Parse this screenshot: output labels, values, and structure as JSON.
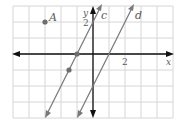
{
  "graph": {
    "origin_px": [
      93,
      54
    ],
    "unit_px": 16,
    "x_range": [
      -5,
      5
    ],
    "y_range": [
      -4,
      3
    ],
    "grid_color": "#d6d6d6",
    "axis_color": "#111111",
    "line_color": "#7a7a7a",
    "point_color": "#6e6e6e",
    "axes": {
      "x_label": "x",
      "y_label": "y",
      "x_tick_label": "2",
      "y_tick_label": "2"
    },
    "point_A": {
      "label": "A",
      "x": -3,
      "y": 2
    },
    "line_c": {
      "label": "c",
      "slope": 2,
      "points": [
        {
          "x": -1,
          "y": 0
        },
        {
          "x": -1.5,
          "y": -1
        }
      ]
    },
    "line_d": {
      "label": "d",
      "slope": 2,
      "x_intercept": 1
    }
  }
}
